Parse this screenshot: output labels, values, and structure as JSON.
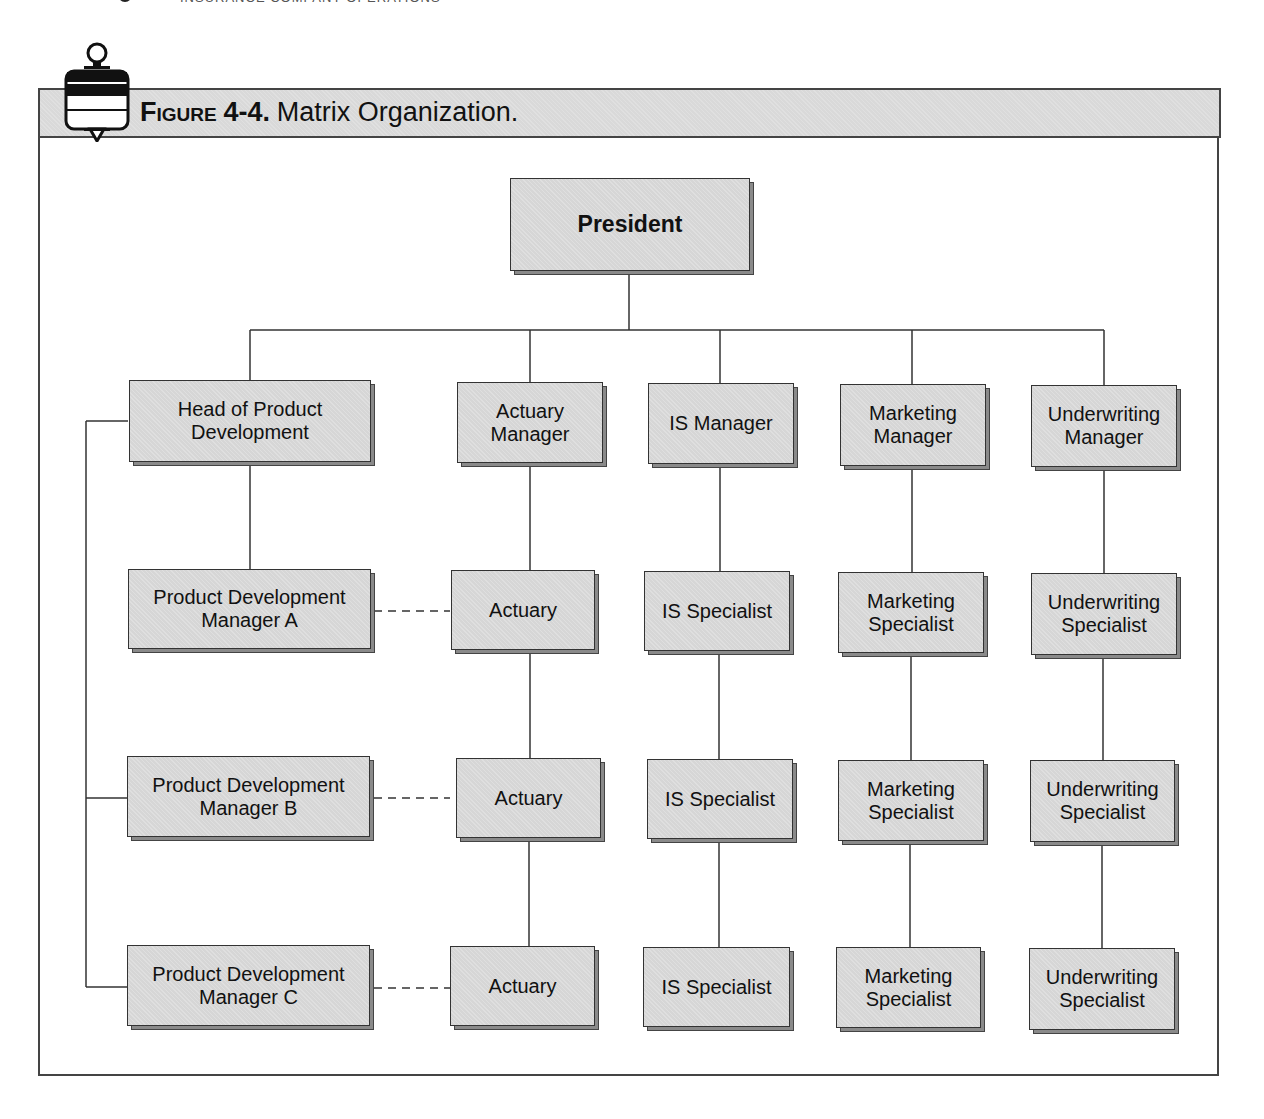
{
  "running_head": {
    "page_number": "72",
    "text": "Insurance Company Operations"
  },
  "figure": {
    "label": "Figure",
    "number": "4-4.",
    "caption": "Matrix Organization.",
    "icon": "pushpin-icon"
  },
  "org_chart": {
    "top": {
      "id": "president",
      "label": "President"
    },
    "columns": [
      {
        "id": "product-development",
        "head": "Head of Product Development",
        "members": [
          "Product Development Manager A",
          "Product Development Manager B",
          "Product Development Manager C"
        ]
      },
      {
        "id": "actuarial",
        "head": "Actuary Manager",
        "members": [
          "Actuary",
          "Actuary",
          "Actuary"
        ]
      },
      {
        "id": "is",
        "head": "IS Manager",
        "members": [
          "IS Specialist",
          "IS Specialist",
          "IS Specialist"
        ]
      },
      {
        "id": "marketing",
        "head": "Marketing Manager",
        "members": [
          "Marketing Specialist",
          "Marketing Specialist",
          "Marketing Specialist"
        ]
      },
      {
        "id": "underwriting",
        "head": "Underwriting Manager",
        "members": [
          "Underwriting Specialist",
          "Underwriting Specialist",
          "Underwriting Specialist"
        ]
      }
    ],
    "dotted_links": [
      {
        "from": "Product Development Manager A",
        "to": "Actuary (row 1)"
      },
      {
        "from": "Product Development Manager B",
        "to": "Actuary (row 2)"
      },
      {
        "from": "Product Development Manager C",
        "to": "Actuary (row 3)"
      }
    ]
  },
  "colors": {
    "box_fill": "#d6d6d6",
    "box_border": "#333333",
    "band_fill": "#d9d9d9",
    "line": "#333333"
  }
}
